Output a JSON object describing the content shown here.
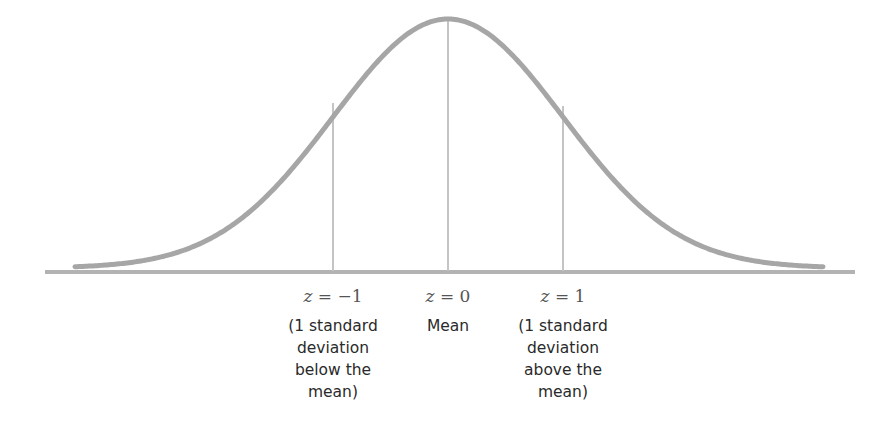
{
  "chart_data": {
    "type": "line",
    "title": "",
    "subtitle": "Normal distribution with z-scores",
    "xlabel": "",
    "ylabel": "",
    "grid": false,
    "legend": null,
    "curve": "normal",
    "x": [
      -3,
      -2,
      -1,
      0,
      1,
      2,
      3
    ],
    "markers": [
      {
        "z": -1,
        "label": "z = −1",
        "description": "(1 standard deviation below the mean)"
      },
      {
        "z": 0,
        "label": "z = 0",
        "description": "Mean"
      },
      {
        "z": 1,
        "label": "z = 1",
        "description": "(1 standard deviation above the mean)"
      }
    ]
  },
  "colors": {
    "curve": "#a6a6a6",
    "baseline": "#b3b3b3",
    "marker_lines": "#c4c4c4",
    "z_text": "#555555",
    "desc_text": "#2a2a2a"
  },
  "labels": {
    "z_minus1": {
      "var": "z",
      "eq": " = −1"
    },
    "z_zero": {
      "var": "z",
      "eq": " = 0"
    },
    "z_plus1": {
      "var": "z",
      "eq": " = 1"
    },
    "desc_minus1": "(1 standard\ndeviation\nbelow the\nmean)",
    "desc_zero": "Mean",
    "desc_plus1": "(1 standard\ndeviation\nabove the\nmean)"
  }
}
